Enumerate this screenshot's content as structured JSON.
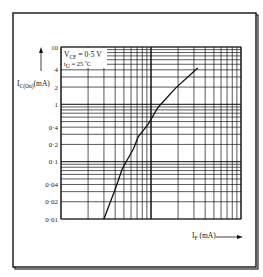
{
  "chart_data": {
    "type": "line",
    "title": "",
    "xlabel": "I_F (mA)",
    "ylabel": "I_C(On) (mA)",
    "xscale": "log",
    "yscale": "log",
    "xlim": [
      1,
      100
    ],
    "ylim": [
      0.01,
      10
    ],
    "grid": true,
    "y_tick_labels": [
      "10",
      "4",
      "2",
      "1",
      "0·4",
      "0·2",
      "0·1",
      "0·04",
      "0·02",
      "0·01"
    ],
    "y_tick_values": [
      10,
      4,
      2,
      1,
      0.4,
      0.2,
      0.1,
      0.04,
      0.02,
      0.01
    ],
    "x_tick_labels": [],
    "annotations": [
      "V_CE = 0·5 V",
      "t_U = 25 ºC"
    ],
    "series": [
      {
        "name": "I_C(On) vs I_F",
        "x": [
          3.0,
          4.0,
          4.8,
          6.4,
          7.2,
          9.3,
          12,
          19,
          33
        ],
        "y": [
          0.01,
          0.033,
          0.075,
          0.17,
          0.27,
          0.45,
          0.89,
          1.96,
          4.3
        ]
      }
    ]
  },
  "labels": {
    "ylabel_main": "I",
    "ylabel_sub": "C(On)",
    "ylabel_unit": "(mA)",
    "xlabel_main": "I",
    "xlabel_sub": "F",
    "xlabel_unit": " (mA)",
    "legend_line1_main": "V",
    "legend_line1_sub": "CE",
    "legend_line1_rest": " = 0·5 V",
    "legend_line2_main": "t",
    "legend_line2_sub": "U",
    "legend_line2_rest": " = 25 ºC"
  }
}
